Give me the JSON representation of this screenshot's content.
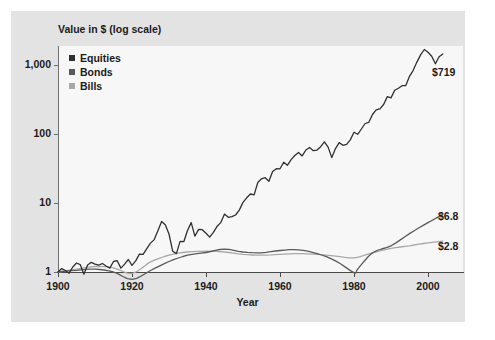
{
  "chart_data": {
    "type": "line",
    "title": "",
    "ylabel": "Value in $ (log scale)",
    "xlabel": "Year",
    "yscale": "log",
    "ylim": [
      1,
      1000
    ],
    "xlim": [
      1900,
      2005
    ],
    "ytick_labels": [
      "1,000",
      "100",
      "10",
      "1"
    ],
    "ytick_values": [
      1000,
      100,
      10,
      1
    ],
    "xtick_labels": [
      "1900",
      "1920",
      "1940",
      "1960",
      "1980",
      "2000"
    ],
    "xtick_values": [
      1900,
      1920,
      1940,
      1960,
      1980,
      2000
    ],
    "grid": false,
    "legend_position": "top-left",
    "colors": {
      "equities": "#303030",
      "bonds": "#5a5a5a",
      "bills": "#a8a8a8",
      "panel": "#e3e3e3",
      "plot_background": "#f7f7f7",
      "axis": "#4a4a4a",
      "text": "#1b1b1b"
    },
    "end_labels": [
      {
        "series": "Equities",
        "text": "$719",
        "value": 719
      },
      {
        "series": "Bonds",
        "text": "$6.8",
        "value": 6.8
      },
      {
        "series": "Bills",
        "text": "$2.8",
        "value": 2.8
      }
    ],
    "series": [
      {
        "name": "Equities",
        "color": "#303030",
        "x": [
          1900,
          1901,
          1902,
          1903,
          1904,
          1905,
          1906,
          1907,
          1908,
          1909,
          1910,
          1911,
          1912,
          1913,
          1914,
          1915,
          1916,
          1917,
          1918,
          1919,
          1920,
          1921,
          1922,
          1923,
          1924,
          1925,
          1926,
          1927,
          1928,
          1929,
          1930,
          1931,
          1932,
          1933,
          1934,
          1935,
          1936,
          1937,
          1938,
          1939,
          1940,
          1941,
          1942,
          1943,
          1944,
          1945,
          1946,
          1947,
          1948,
          1949,
          1950,
          1951,
          1952,
          1953,
          1954,
          1955,
          1956,
          1957,
          1958,
          1959,
          1960,
          1961,
          1962,
          1963,
          1964,
          1965,
          1966,
          1967,
          1968,
          1969,
          1970,
          1971,
          1972,
          1973,
          1974,
          1975,
          1976,
          1977,
          1978,
          1979,
          1980,
          1981,
          1982,
          1983,
          1984,
          1985,
          1986,
          1987,
          1988,
          1989,
          1990,
          1991,
          1992,
          1993,
          1994,
          1995,
          1996,
          1997,
          1998,
          1999,
          2000,
          2001,
          2002,
          2003,
          2004
        ],
        "values": [
          1.0,
          1.12,
          1.05,
          0.96,
          1.18,
          1.35,
          1.28,
          0.93,
          1.26,
          1.38,
          1.3,
          1.26,
          1.33,
          1.22,
          1.14,
          1.42,
          1.46,
          1.14,
          1.3,
          1.52,
          1.25,
          1.45,
          1.82,
          1.8,
          2.18,
          2.62,
          2.95,
          3.95,
          5.4,
          4.85,
          3.55,
          2.0,
          1.85,
          2.78,
          2.75,
          4.0,
          5.2,
          3.3,
          4.15,
          4.1,
          3.65,
          3.2,
          3.75,
          4.6,
          5.2,
          6.9,
          6.2,
          6.35,
          6.7,
          7.9,
          10.2,
          11.9,
          13.5,
          13.1,
          19.8,
          22.4,
          23.3,
          20.6,
          28.6,
          31.4,
          31.3,
          39.0,
          35.2,
          42.5,
          48.8,
          54.0,
          48.2,
          58.6,
          63.8,
          57.2,
          58.5,
          65.5,
          77.0,
          64.5,
          45.5,
          61.5,
          75.0,
          68.5,
          71.0,
          82.0,
          106.0,
          99.0,
          118.0,
          142.0,
          148.0,
          192.0,
          224.0,
          232.0,
          268.0,
          348.0,
          334.0,
          430.0,
          460.0,
          502.0,
          504.0,
          686.0,
          838.0,
          1100.0,
          1400.0,
          1680.0,
          1530.0,
          1340.0,
          1040.0,
          1320.0,
          1450.0
        ]
      },
      {
        "name": "Bonds",
        "color": "#5a5a5a",
        "x": [
          1900,
          1905,
          1910,
          1915,
          1920,
          1925,
          1930,
          1935,
          1940,
          1945,
          1950,
          1955,
          1960,
          1965,
          1970,
          1975,
          1980,
          1981,
          1985,
          1990,
          1995,
          2000,
          2004
        ],
        "values": [
          1.0,
          1.06,
          1.1,
          1.0,
          0.78,
          1.05,
          1.42,
          1.75,
          1.92,
          2.15,
          1.95,
          1.9,
          2.05,
          2.1,
          1.85,
          1.45,
          0.98,
          1.1,
          1.9,
          2.4,
          3.6,
          5.2,
          6.8
        ]
      },
      {
        "name": "Bills",
        "color": "#a8a8a8",
        "x": [
          1900,
          1905,
          1910,
          1915,
          1920,
          1925,
          1930,
          1935,
          1940,
          1945,
          1950,
          1955,
          1960,
          1965,
          1970,
          1975,
          1980,
          1985,
          1990,
          1995,
          2000,
          2004
        ],
        "values": [
          1.0,
          1.1,
          1.2,
          1.15,
          0.95,
          1.4,
          1.75,
          1.95,
          2.0,
          1.95,
          1.8,
          1.75,
          1.8,
          1.85,
          1.8,
          1.7,
          1.6,
          1.9,
          2.2,
          2.4,
          2.65,
          2.8
        ]
      }
    ]
  },
  "legend": {
    "items": [
      {
        "label": "Equities",
        "color": "#303030"
      },
      {
        "label": "Bonds",
        "color": "#5a5a5a"
      },
      {
        "label": "Bills",
        "color": "#a8a8a8"
      }
    ]
  }
}
